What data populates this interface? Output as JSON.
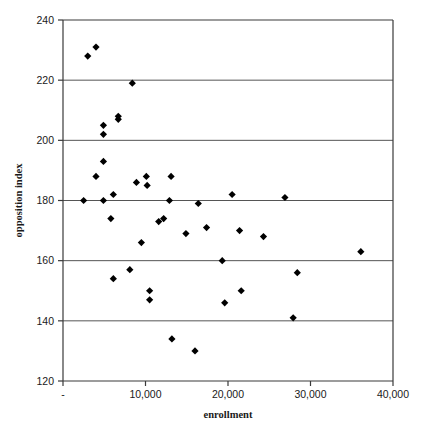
{
  "chart_data": {
    "type": "scatter",
    "title": "",
    "xlabel": "enrollment",
    "ylabel": "opposition index",
    "xlim": [
      0,
      40000
    ],
    "ylim": [
      120,
      240
    ],
    "x_tick_values": [
      0,
      10000,
      20000,
      30000,
      40000
    ],
    "x_tick_labels": [
      "-",
      "10,000",
      "20,000",
      "30,000",
      "40,000"
    ],
    "y_tick_values": [
      120,
      140,
      160,
      180,
      200,
      220,
      240
    ],
    "y_tick_labels": [
      "120",
      "140",
      "160",
      "180",
      "200",
      "220",
      "240"
    ],
    "grid": "horizontal",
    "gridline_values": [
      140,
      160,
      180,
      200,
      220
    ],
    "legend": "none",
    "marker": "diamond",
    "marker_color": "#000000",
    "marker_size": 6,
    "points": [
      {
        "x": 3000,
        "y": 228
      },
      {
        "x": 4000,
        "y": 231
      },
      {
        "x": 8400,
        "y": 219
      },
      {
        "x": 4900,
        "y": 205
      },
      {
        "x": 4900,
        "y": 202
      },
      {
        "x": 6700,
        "y": 208
      },
      {
        "x": 6700,
        "y": 207
      },
      {
        "x": 4900,
        "y": 193
      },
      {
        "x": 4000,
        "y": 188
      },
      {
        "x": 2500,
        "y": 180
      },
      {
        "x": 4900,
        "y": 180
      },
      {
        "x": 6100,
        "y": 182
      },
      {
        "x": 8900,
        "y": 186
      },
      {
        "x": 10100,
        "y": 188
      },
      {
        "x": 10200,
        "y": 185
      },
      {
        "x": 13100,
        "y": 188
      },
      {
        "x": 12900,
        "y": 180
      },
      {
        "x": 16400,
        "y": 179
      },
      {
        "x": 20500,
        "y": 182
      },
      {
        "x": 26900,
        "y": 181
      },
      {
        "x": 5800,
        "y": 174
      },
      {
        "x": 11600,
        "y": 173
      },
      {
        "x": 12200,
        "y": 174
      },
      {
        "x": 14900,
        "y": 169
      },
      {
        "x": 17400,
        "y": 171
      },
      {
        "x": 21400,
        "y": 170
      },
      {
        "x": 24300,
        "y": 168
      },
      {
        "x": 9500,
        "y": 166
      },
      {
        "x": 36100,
        "y": 163
      },
      {
        "x": 19300,
        "y": 160
      },
      {
        "x": 8100,
        "y": 157
      },
      {
        "x": 6100,
        "y": 154
      },
      {
        "x": 28400,
        "y": 156
      },
      {
        "x": 10500,
        "y": 150
      },
      {
        "x": 10500,
        "y": 147
      },
      {
        "x": 21600,
        "y": 150
      },
      {
        "x": 19600,
        "y": 146
      },
      {
        "x": 27900,
        "y": 141
      },
      {
        "x": 13200,
        "y": 134
      },
      {
        "x": 16000,
        "y": 130
      }
    ]
  },
  "geometry": {
    "plot_left": 63,
    "plot_right": 393,
    "plot_top": 20,
    "plot_bottom": 381
  },
  "colors": {
    "frame": "#3a3a3a",
    "gridline": "#555555",
    "marker": "#000000",
    "background": "#ffffff"
  }
}
